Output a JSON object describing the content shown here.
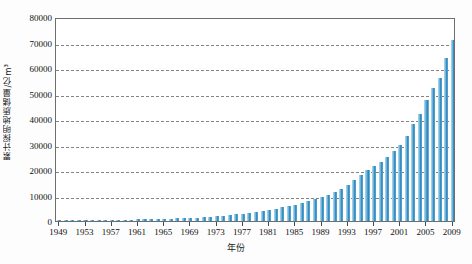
{
  "chart_data": {
    "type": "bar",
    "title": "",
    "xlabel": "年份",
    "ylabel": "累计探明地质储量/亿m³",
    "ylim": [
      0,
      80000
    ],
    "ytick_step": 10000,
    "yticks": [
      "0",
      "10000",
      "20000",
      "30000",
      "40000",
      "50000",
      "60000",
      "70000",
      "80000"
    ],
    "grid": true,
    "grid_style": "dashed-horizontal",
    "legend": "none",
    "xtick_step": 4,
    "xticks": [
      "1949",
      "1953",
      "1957",
      "1961",
      "1965",
      "1969",
      "1973",
      "1977",
      "1981",
      "1985",
      "1989",
      "1993",
      "1997",
      "2001",
      "2005",
      "2009"
    ],
    "bar_color": "#2f86bd",
    "bar_highlight_color": "#8ec6e4",
    "axis_color": "#6e6e6e",
    "categories": [
      "1949",
      "1950",
      "1951",
      "1952",
      "1953",
      "1954",
      "1955",
      "1956",
      "1957",
      "1958",
      "1959",
      "1960",
      "1961",
      "1962",
      "1963",
      "1964",
      "1965",
      "1966",
      "1967",
      "1968",
      "1969",
      "1970",
      "1971",
      "1972",
      "1973",
      "1974",
      "1975",
      "1976",
      "1977",
      "1978",
      "1979",
      "1980",
      "1981",
      "1982",
      "1983",
      "1984",
      "1985",
      "1986",
      "1987",
      "1988",
      "1989",
      "1990",
      "1991",
      "1992",
      "1993",
      "1994",
      "1995",
      "1996",
      "1997",
      "1998",
      "1999",
      "2000",
      "2001",
      "2002",
      "2003",
      "2004",
      "2005",
      "2006",
      "2007",
      "2008",
      "2009"
    ],
    "values": [
      100,
      120,
      150,
      180,
      210,
      250,
      290,
      330,
      380,
      430,
      480,
      540,
      600,
      660,
      720,
      790,
      860,
      940,
      1030,
      1120,
      1230,
      1350,
      1490,
      1650,
      1840,
      2050,
      2290,
      2560,
      2860,
      3190,
      3550,
      3950,
      4380,
      4840,
      5330,
      5860,
      6430,
      7050,
      7720,
      8450,
      9250,
      10150,
      11200,
      12500,
      14100,
      16000,
      18200,
      20000,
      21500,
      23000,
      25000,
      27500,
      30000,
      33500,
      38000,
      42000,
      47500,
      52000,
      56000,
      64000,
      71000
    ]
  }
}
